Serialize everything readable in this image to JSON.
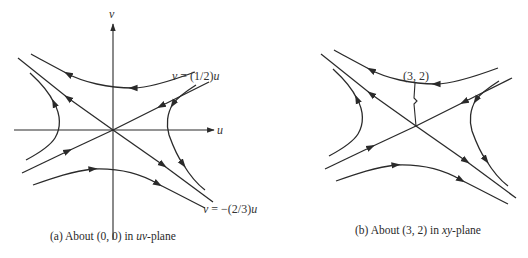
{
  "panel_a": {
    "caption_prefix": "(a) About (0, 0) in ",
    "caption_var": "uv",
    "caption_suffix": "-plane",
    "axis_u_label": "u",
    "axis_v_label": "v",
    "line1_label_lhs": "v",
    "line1_label_rhs": " = (1/2)",
    "line1_label_var": "u",
    "line2_label_lhs": "v",
    "line2_label_rhs": " = −(2/3)",
    "line2_label_var": "u"
  },
  "panel_b": {
    "caption_prefix": "(b) About (3, 2) in ",
    "caption_var": "xy",
    "caption_suffix": "-plane",
    "point_label": "(3, 2)"
  },
  "colors": {
    "stroke": "#2a2a2a",
    "background": "#ffffff"
  }
}
